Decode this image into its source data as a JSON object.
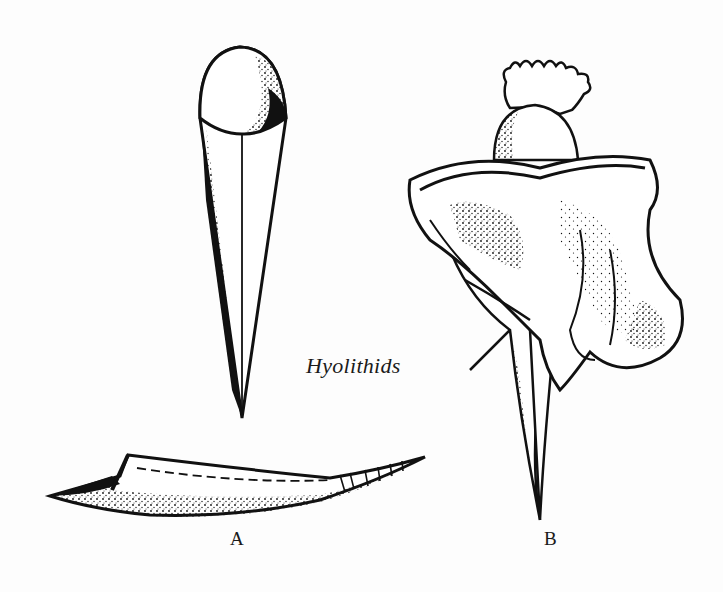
{
  "figure": {
    "title": "Hyolithids",
    "labels": {
      "a": "A",
      "b": "B"
    },
    "colors": {
      "ink": "#111111",
      "paper": "#fdfdfd"
    },
    "illustrations": [
      {
        "id": "hyolithid-conical-shell-vertical",
        "description": "Conical hyolithid shell with operculum, viewed from above"
      },
      {
        "id": "hyolithid-shell-lateral",
        "description": "Curved hyolithid shell in side view",
        "label": "A"
      },
      {
        "id": "hyolithid-reconstruction",
        "description": "Reconstruction of hyolithid with tentacles, operculum and helens",
        "label": "B"
      }
    ]
  }
}
